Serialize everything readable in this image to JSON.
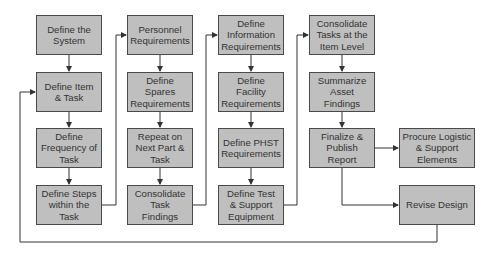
{
  "diagram": {
    "type": "process-flowchart",
    "colors": {
      "box_fill": "#bfbfbf",
      "box_border": "#4a4a4a",
      "line": "#333333",
      "background": "#ffffff"
    },
    "columns": [
      {
        "id": "col1",
        "boxes": [
          {
            "id": "define-system",
            "label": "Define the\nSystem"
          },
          {
            "id": "define-item-task",
            "label": "Define Item\n& Task"
          },
          {
            "id": "define-frequency",
            "label": "Define\nFrequency of\nTask"
          },
          {
            "id": "define-steps",
            "label": "Define Steps\nwithin the\nTask"
          }
        ]
      },
      {
        "id": "col2",
        "boxes": [
          {
            "id": "personnel-req",
            "label": "Personnel\nRequirements"
          },
          {
            "id": "spares-req",
            "label": "Define\nSpares\nRequirements"
          },
          {
            "id": "repeat-next",
            "label": "Repeat on\nNext Part &\nTask"
          },
          {
            "id": "consolidate-task",
            "label": "Consolidate\nTask\nFindings"
          }
        ]
      },
      {
        "id": "col3",
        "boxes": [
          {
            "id": "information-req",
            "label": "Define\nInformation\nRequirements"
          },
          {
            "id": "facility-req",
            "label": "Define\nFacility\nRequirements"
          },
          {
            "id": "phst-req",
            "label": "Define PHST\nRequirements"
          },
          {
            "id": "test-support",
            "label": "Define Test\n& Support\nEquipment"
          }
        ]
      },
      {
        "id": "col4",
        "boxes": [
          {
            "id": "consolidate-item",
            "label": "Consolidate\nTasks at the\nItem Level"
          },
          {
            "id": "summarize-asset",
            "label": "Summarize\nAsset\nFindings"
          },
          {
            "id": "finalize-publish",
            "label": "Finalize &\nPublish\nReport"
          }
        ]
      },
      {
        "id": "col5",
        "boxes": [
          {
            "id": "procure-logistic",
            "label": "Procure Logistic\n& Support\nElements"
          },
          {
            "id": "revise-design",
            "label": "Revise Design"
          }
        ]
      }
    ],
    "connections": [
      [
        "define-system",
        "define-item-task"
      ],
      [
        "define-item-task",
        "define-frequency"
      ],
      [
        "define-frequency",
        "define-steps"
      ],
      [
        "define-steps",
        "personnel-req"
      ],
      [
        "personnel-req",
        "spares-req"
      ],
      [
        "spares-req",
        "repeat-next"
      ],
      [
        "repeat-next",
        "consolidate-task"
      ],
      [
        "consolidate-task",
        "information-req"
      ],
      [
        "information-req",
        "facility-req"
      ],
      [
        "facility-req",
        "phst-req"
      ],
      [
        "phst-req",
        "test-support"
      ],
      [
        "test-support",
        "consolidate-item"
      ],
      [
        "consolidate-item",
        "summarize-asset"
      ],
      [
        "summarize-asset",
        "finalize-publish"
      ],
      [
        "finalize-publish",
        "procure-logistic"
      ],
      [
        "finalize-publish",
        "revise-design"
      ],
      [
        "revise-design",
        "define-item-task"
      ]
    ]
  }
}
